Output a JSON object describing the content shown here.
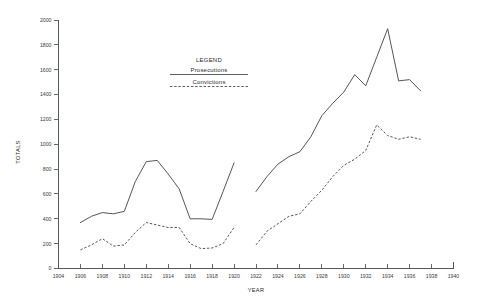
{
  "chart_data": {
    "type": "line",
    "title": "",
    "xlabel": "YEAR",
    "ylabel": "TOTALS",
    "xlim": [
      1904,
      1940
    ],
    "ylim": [
      0,
      2000
    ],
    "xticks": [
      1904,
      1906,
      1908,
      1910,
      1912,
      1914,
      1916,
      1918,
      1920,
      1922,
      1924,
      1926,
      1928,
      1930,
      1932,
      1934,
      1936,
      1938,
      1940
    ],
    "yticks": [
      0,
      200,
      400,
      600,
      800,
      1000,
      1200,
      1400,
      1600,
      1800,
      2000
    ],
    "grid": false,
    "legend_position": "top-center",
    "legend_title": "LEGEND",
    "series": [
      {
        "name": "Prosecutions",
        "style": "solid",
        "segments": [
          {
            "x": [
              1906,
              1907,
              1908,
              1909,
              1910,
              1911,
              1912,
              1913,
              1914,
              1915,
              1916,
              1917,
              1918,
              1919,
              1920
            ],
            "values": [
              370,
              420,
              450,
              440,
              460,
              700,
              860,
              870,
              760,
              640,
              400,
              400,
              395,
              620,
              850
            ]
          },
          {
            "x": [
              1922,
              1923,
              1924,
              1925,
              1926,
              1927,
              1928,
              1929,
              1930,
              1931,
              1932,
              1933,
              1934,
              1935,
              1936,
              1937
            ],
            "values": [
              620,
              740,
              840,
              900,
              940,
              1060,
              1230,
              1330,
              1420,
              1560,
              1470,
              1700,
              1930,
              1510,
              1520,
              1430
            ]
          }
        ]
      },
      {
        "name": "Convictions",
        "style": "dashed",
        "segments": [
          {
            "x": [
              1906,
              1907,
              1908,
              1909,
              1910,
              1911,
              1912,
              1913,
              1914,
              1915,
              1916,
              1917,
              1918,
              1919,
              1920
            ],
            "values": [
              150,
              190,
              240,
              180,
              190,
              290,
              370,
              350,
              330,
              330,
              200,
              160,
              165,
              200,
              330
            ]
          },
          {
            "x": [
              1922,
              1923,
              1924,
              1925,
              1926,
              1927,
              1928,
              1929,
              1930,
              1931,
              1932,
              1933,
              1934,
              1935,
              1936,
              1937
            ],
            "values": [
              190,
              300,
              360,
              420,
              440,
              540,
              630,
              740,
              830,
              880,
              950,
              1155,
              1070,
              1040,
              1060,
              1040
            ]
          }
        ]
      }
    ],
    "colors": {
      "line": "#4a4d50",
      "axis": "#55585a",
      "text": "#2b2b2b",
      "background": "#ffffff"
    }
  },
  "legend": {
    "title": "LEGEND",
    "entries": [
      {
        "label": "Prosecutions",
        "style": "solid"
      },
      {
        "label": "Convictions",
        "style": "dashed"
      }
    ]
  },
  "axes": {
    "y_title": "TOTALS",
    "x_title": "YEAR"
  }
}
